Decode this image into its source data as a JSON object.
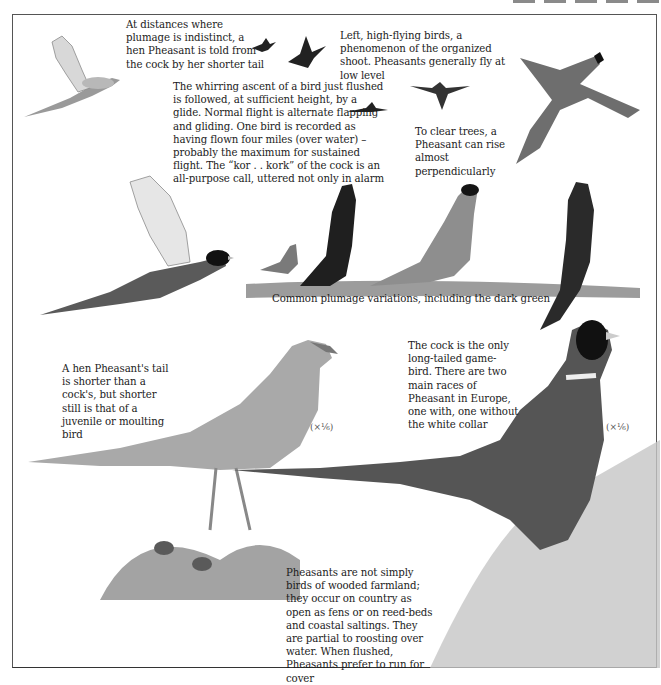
{
  "page": {
    "subject": "Pheasant",
    "top_marks_count": 5
  },
  "captions": {
    "hen_distance": "At distances where plumage is indistinct, a hen Pheasant is told from the cock by her shorter tail",
    "high_flying": "Left, high-flying birds, a phenomenon of the organized shoot. Pheasants generally fly at low level",
    "flight": "The whirring ascent of a bird just flushed is followed, at sufficient height, by a glide. Normal flight is alternate flapping and gliding. One bird is recorded as having flown four miles (over water) – probably the maximum for sustained flight. The “kor . . kork” of the cock is an all-purpose call, uttered not only in alarm",
    "clear_trees": "To clear trees, a Pheasant can rise almost perpendicularly",
    "plumage_variations": "Common plumage variations, including the dark green",
    "hen_tail": "A hen Pheasant's tail is shorter than a cock's, but shorter still is that of a juvenile or moulting bird",
    "cock": "The cock is the only long-tailed game-bird. There are two main races of Pheasant in Europe, one with, one without the white collar",
    "habitat": "Pheasants are not simply birds of wooded farmland; they occur on country as open as fens or on reed-beds and coastal saltings. They are partial to roosting over water. When flushed, Pheasants prefer to run for cover"
  },
  "scales": {
    "hen_scale": "(×¹⁄₆)",
    "cock_scale": "(×¹⁄₆)"
  },
  "illustrations": [
    {
      "id": "hen-in-flight",
      "label": "hen pheasant in flight"
    },
    {
      "id": "distant-flying-birds",
      "label": "two distant high-flying pheasants"
    },
    {
      "id": "gliding-bird",
      "label": "small gliding pheasant silhouette"
    },
    {
      "id": "distant-glider",
      "label": "distant pheasant silhouette gliding"
    },
    {
      "id": "cock-rising",
      "label": "cock pheasant rising steeply"
    },
    {
      "id": "cock-flying",
      "label": "cock pheasant in level flight"
    },
    {
      "id": "plumage-group",
      "label": "four pheasants showing plumage variations"
    },
    {
      "id": "hen-standing",
      "label": "hen pheasant standing in grass with chicks"
    },
    {
      "id": "cock-standing",
      "label": "ring-necked cock pheasant in reeds"
    }
  ],
  "colors": {
    "ink": "#1c1c1c",
    "frame": "#555555",
    "grass": "#8c8c8c"
  }
}
